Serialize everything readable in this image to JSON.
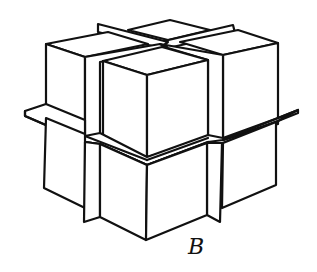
{
  "figure": {
    "type": "isometric-diagram",
    "label": "B",
    "colors": {
      "stroke": "#111111",
      "fill": "#ffffff"
    }
  }
}
